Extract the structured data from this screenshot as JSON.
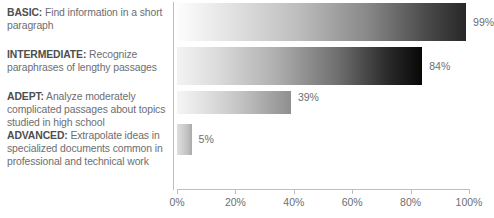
{
  "chart_data": {
    "type": "bar",
    "orientation": "horizontal",
    "title": "",
    "xlabel": "",
    "ylabel": "",
    "xlim": [
      0,
      100
    ],
    "grid": false,
    "legend_position": "left-descriptions",
    "categories": [
      "BASIC",
      "INTERMEDIATE",
      "ADEPT",
      "ADVANCED"
    ],
    "values": [
      99,
      84,
      39,
      5
    ],
    "value_labels": [
      "99%",
      "84%",
      "39%",
      "5%"
    ],
    "tick_labels": [
      "0%",
      "20%",
      "40%",
      "60%",
      "80%",
      "100%"
    ],
    "tick_values": [
      0,
      20,
      40,
      60,
      80,
      100
    ],
    "bar_style": "light-to-dark horizontal gradient",
    "colors": {
      "text": "#6d6e71",
      "term": "#4d4e50",
      "axis": "#bcbec0",
      "background": "#ffffff"
    }
  },
  "descriptions": [
    {
      "term": "BASIC:",
      "text": " Find information in a short paragraph"
    },
    {
      "term": "INTERMEDIATE:",
      "text": " Recognize paraphrases of lengthy passages"
    },
    {
      "term": "ADEPT:",
      "text": " Analyze moderately complicated passages about topics studied in high school"
    },
    {
      "term": "ADVANCED:",
      "text": " Extrapolate ideas in specialized documents common in professional and technical work"
    }
  ]
}
